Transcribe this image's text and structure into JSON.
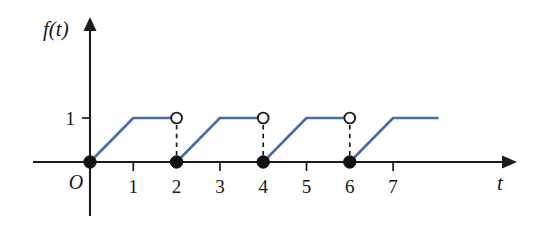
{
  "chart_data": {
    "type": "line",
    "title": "",
    "subtitle": "",
    "xlabel": "t",
    "ylabel": "f(t)",
    "origin_label": "O",
    "grid": false,
    "legend": null,
    "xlim": [
      -1.3,
      9.6
    ],
    "ylim": [
      -1.05,
      3.25
    ],
    "x_ticks": [
      1,
      2,
      3,
      4,
      5,
      6,
      7
    ],
    "x_tick_labels": [
      "1",
      "2",
      "3",
      "4",
      "5",
      "6",
      "7"
    ],
    "y_ticks": [
      1
    ],
    "y_tick_labels": [
      "1"
    ],
    "series": [
      {
        "name": "f(t)",
        "color": "#4a6ba5",
        "segments": [
          {
            "points": [
              [
                0,
                0
              ],
              [
                1,
                1
              ],
              [
                2,
                1
              ]
            ]
          },
          {
            "points": [
              [
                2,
                0
              ],
              [
                3,
                1
              ],
              [
                4,
                1
              ]
            ]
          },
          {
            "points": [
              [
                4,
                0
              ],
              [
                5,
                1
              ],
              [
                6,
                1
              ]
            ]
          },
          {
            "points": [
              [
                6,
                0
              ],
              [
                7,
                1
              ],
              [
                8.05,
                1
              ]
            ]
          }
        ]
      }
    ],
    "closed_points": [
      [
        0,
        0
      ],
      [
        2,
        0
      ],
      [
        4,
        0
      ],
      [
        6,
        0
      ]
    ],
    "open_points": [
      [
        2,
        1
      ],
      [
        4,
        1
      ],
      [
        6,
        1
      ]
    ],
    "drop_lines": [
      {
        "x": 2,
        "y_top": 1,
        "y_bottom": 0
      },
      {
        "x": 4,
        "y_top": 1,
        "y_bottom": 0
      },
      {
        "x": 6,
        "y_top": 1,
        "y_bottom": 0
      }
    ],
    "colors": {
      "curve": "#4a6ba5",
      "axis": "#1c1c1c",
      "point_fill": "#111111",
      "open_point_fill": "#ffffff",
      "background": "#ffffff"
    }
  }
}
